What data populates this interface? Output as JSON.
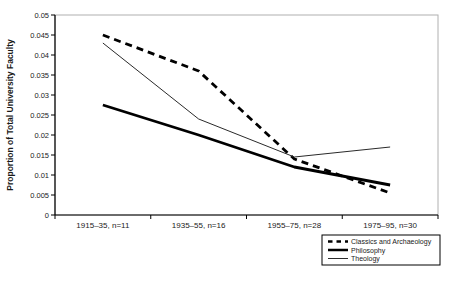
{
  "chart_data": {
    "type": "line",
    "title": "",
    "xlabel": "",
    "ylabel": "Proportion of Total University Faculty",
    "ylim": [
      0,
      0.05
    ],
    "yticks": [
      0,
      0.005,
      0.01,
      0.015,
      0.02,
      0.025,
      0.03,
      0.035,
      0.04,
      0.045,
      0.05
    ],
    "ytick_labels": [
      "0",
      "0.005",
      "0.01",
      "0.015",
      "0.02",
      "0.025",
      "0.03",
      "0.035",
      "0.04",
      "0.045",
      "0.05"
    ],
    "categories": [
      "1915–35, n=11",
      "1935–55, n=16",
      "1955–75, n=28",
      "1975–95, n=30"
    ],
    "series": [
      {
        "name": "Classics and Archaeology",
        "style": "dashed-thick",
        "values": [
          0.045,
          0.036,
          0.014,
          0.0055
        ]
      },
      {
        "name": "Philosophy",
        "style": "solid-thick",
        "values": [
          0.0275,
          0.02,
          0.012,
          0.0075
        ]
      },
      {
        "name": "Theology",
        "style": "solid-thin",
        "values": [
          0.043,
          0.024,
          0.0145,
          0.017
        ]
      }
    ],
    "grid": false,
    "legend_position": "bottom-right",
    "colors": {
      "line": "#000000",
      "plot_border": "#b0b0b0",
      "axis": "#000000",
      "background": "#ffffff"
    }
  }
}
